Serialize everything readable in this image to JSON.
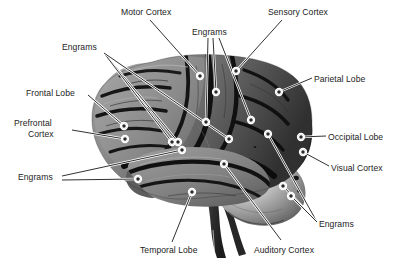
{
  "figure": {
    "background_color": "#ffffff",
    "text_color": "#1c1c1c",
    "leader_color": "#1a1a1a",
    "width": 414,
    "height": 268
  },
  "labels": [
    {
      "id": "motor-cortex",
      "text": "Motor Cortex",
      "x": 121,
      "y": 7,
      "align": "left"
    },
    {
      "id": "engrams-top",
      "text": "Engrams",
      "x": 192,
      "y": 27,
      "align": "left"
    },
    {
      "id": "sensory-cortex",
      "text": "Sensory Cortex",
      "x": 268,
      "y": 7,
      "align": "left"
    },
    {
      "id": "engrams-upleft",
      "text": "Engrams",
      "x": 62,
      "y": 42,
      "align": "left"
    },
    {
      "id": "parietal-lobe",
      "text": "Parietal Lobe",
      "x": 314,
      "y": 74,
      "align": "left"
    },
    {
      "id": "frontal-lobe",
      "text": "Frontal Lobe",
      "x": 26,
      "y": 88,
      "align": "left"
    },
    {
      "id": "prefrontal-l1",
      "text": "Prefrontal",
      "x": 14,
      "y": 118,
      "align": "left"
    },
    {
      "id": "prefrontal-l2",
      "text": "Cortex",
      "x": 28,
      "y": 129,
      "align": "left"
    },
    {
      "id": "occipital-lobe",
      "text": "Occipital Lobe",
      "x": 328,
      "y": 132,
      "align": "left"
    },
    {
      "id": "visual-cortex",
      "text": "Visual Cortex",
      "x": 331,
      "y": 163,
      "align": "left"
    },
    {
      "id": "engrams-left",
      "text": "Engrams",
      "x": 18,
      "y": 172,
      "align": "left"
    },
    {
      "id": "engrams-right",
      "text": "Engrams",
      "x": 319,
      "y": 219,
      "align": "left"
    },
    {
      "id": "temporal-lobe",
      "text": "Temporal Lobe",
      "x": 140,
      "y": 245,
      "align": "left"
    },
    {
      "id": "auditory-cortex",
      "text": "Auditory Cortex",
      "x": 254,
      "y": 245,
      "align": "left"
    }
  ],
  "leaders": [
    {
      "id": "leader-motor-cortex",
      "label": "motor-cortex",
      "path": [
        [
          150,
          20
        ],
        [
          200,
          76
        ]
      ],
      "marker": [
        200,
        76
      ]
    },
    {
      "id": "leader-engrams-top-a",
      "label": "engrams-top",
      "path": [
        [
          208,
          38
        ],
        [
          206,
          122
        ]
      ],
      "marker": [
        206,
        122
      ]
    },
    {
      "id": "leader-engrams-top-b",
      "label": "engrams-top",
      "path": [
        [
          213,
          38
        ],
        [
          216,
          92
        ]
      ],
      "marker": [
        216,
        92
      ]
    },
    {
      "id": "leader-engrams-top-c",
      "label": "engrams-top",
      "path": [
        [
          219,
          38
        ],
        [
          251,
          120
        ]
      ],
      "marker": [
        251,
        120
      ]
    },
    {
      "id": "leader-sensory-cortex",
      "label": "sensory-cortex",
      "path": [
        [
          282,
          20
        ],
        [
          236,
          71
        ]
      ],
      "marker": [
        236,
        71
      ]
    },
    {
      "id": "leader-engrams-upleft-a",
      "label": "engrams-upleft",
      "path": [
        [
          104,
          53
        ],
        [
          178,
          142
        ]
      ],
      "marker": [
        178,
        142
      ]
    },
    {
      "id": "leader-engrams-upleft-b",
      "label": "engrams-upleft",
      "path": [
        [
          104,
          53
        ],
        [
          172,
          142
        ]
      ],
      "marker": [
        172,
        142
      ]
    },
    {
      "id": "leader-engrams-upleft-c",
      "label": "engrams-upleft",
      "path": [
        [
          104,
          53
        ],
        [
          229,
          139
        ]
      ],
      "marker": [
        229,
        139
      ]
    },
    {
      "id": "leader-parietal-lobe",
      "label": "parietal-lobe",
      "path": [
        [
          312,
          78
        ],
        [
          279,
          92
        ]
      ],
      "marker": [
        279,
        92
      ]
    },
    {
      "id": "leader-frontal-lobe",
      "label": "frontal-lobe",
      "path": [
        [
          88,
          95
        ],
        [
          124,
          126
        ]
      ],
      "marker": [
        124,
        126
      ]
    },
    {
      "id": "leader-prefrontal",
      "label": "prefrontal-l2",
      "path": [
        [
          72,
          130
        ],
        [
          125,
          139
        ]
      ],
      "marker": [
        125,
        139
      ]
    },
    {
      "id": "leader-occipital-lobe",
      "label": "occipital-lobe",
      "path": [
        [
          326,
          136
        ],
        [
          301,
          137
        ]
      ],
      "marker": [
        301,
        137
      ]
    },
    {
      "id": "leader-visual-cortex",
      "label": "visual-cortex",
      "path": [
        [
          329,
          166
        ],
        [
          303,
          152
        ]
      ],
      "marker": [
        303,
        152
      ]
    },
    {
      "id": "leader-engrams-left-a",
      "label": "engrams-left",
      "path": [
        [
          62,
          176
        ],
        [
          182,
          150
        ]
      ],
      "marker": [
        182,
        150
      ]
    },
    {
      "id": "leader-engrams-left-b",
      "label": "engrams-left",
      "path": [
        [
          62,
          180
        ],
        [
          138,
          179
        ]
      ],
      "marker": [
        138,
        179
      ]
    },
    {
      "id": "leader-engrams-right-a",
      "label": "engrams-right",
      "path": [
        [
          317,
          222
        ],
        [
          268,
          134
        ]
      ],
      "marker": [
        268,
        134
      ]
    },
    {
      "id": "leader-engrams-right-b",
      "label": "engrams-right",
      "path": [
        [
          317,
          222
        ],
        [
          283,
          186
        ]
      ],
      "marker": [
        283,
        186
      ]
    },
    {
      "id": "leader-engrams-right-c",
      "label": "engrams-right",
      "path": [
        [
          317,
          222
        ],
        [
          291,
          196
        ]
      ],
      "marker": [
        291,
        196
      ]
    },
    {
      "id": "leader-temporal-lobe",
      "label": "temporal-lobe",
      "path": [
        [
          172,
          242
        ],
        [
          192,
          192
        ]
      ],
      "marker": [
        192,
        192
      ]
    },
    {
      "id": "leader-auditory-cortex",
      "label": "auditory-cortex",
      "path": [
        [
          281,
          240
        ],
        [
          224,
          164
        ]
      ],
      "marker": [
        224,
        164
      ]
    }
  ],
  "engram_dots": [
    {
      "id": "engram-dot-1",
      "x": 296,
      "y": 178,
      "r": 2.3
    },
    {
      "id": "engram-dot-2",
      "x": 299,
      "y": 191,
      "r": 1.5
    },
    {
      "id": "engram-dot-3",
      "x": 255,
      "y": 147,
      "r": 1.1
    },
    {
      "id": "engram-dot-4",
      "x": 262,
      "y": 131,
      "r": 1.0
    }
  ],
  "anatomy": {
    "regions": [
      "Motor Cortex",
      "Sensory Cortex",
      "Parietal Lobe",
      "Frontal Lobe",
      "Prefrontal Cortex",
      "Occipital Lobe",
      "Visual Cortex",
      "Temporal Lobe",
      "Auditory Cortex"
    ],
    "engram_label_count": 4,
    "view": "left lateral"
  }
}
